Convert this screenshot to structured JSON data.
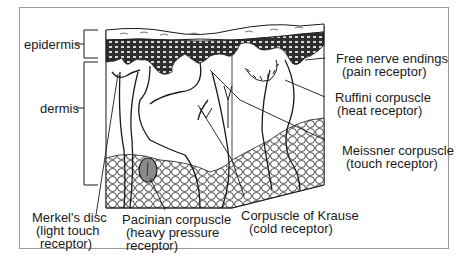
{
  "diagram": {
    "layers": [
      {
        "id": "epidermis",
        "label": "epidermis"
      },
      {
        "id": "dermis",
        "label": "dermis"
      }
    ],
    "receptors": [
      {
        "id": "free-nerve-endings",
        "name": "Free nerve endings",
        "function": "(pain receptor)"
      },
      {
        "id": "ruffini",
        "name": "Ruffini corpuscle",
        "function": "(heat receptor)"
      },
      {
        "id": "meissner",
        "name": "Meissner corpuscle",
        "function": "(touch receptor)"
      },
      {
        "id": "krause",
        "name": "Corpuscle of Krause",
        "function": "(cold receptor)"
      },
      {
        "id": "pacinian",
        "name": "Pacinian corpuscle",
        "function_line1": "(heavy pressure",
        "function_line2": "receptor)"
      },
      {
        "id": "merkel",
        "name": "Merkel's disc",
        "function_line1": "(light touch",
        "function_line2": "receptor)"
      }
    ],
    "colors": {
      "line": "#1a1a1a",
      "frame": "#9a9a9a",
      "epidermis_fill": "#3a3a3a",
      "pacinian_fill": "#8a8a8a"
    }
  }
}
